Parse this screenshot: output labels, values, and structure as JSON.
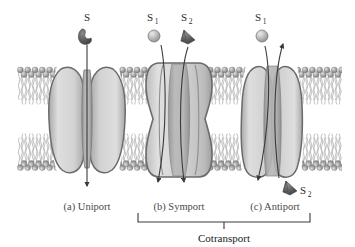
{
  "figure": {
    "background": "#ffffff"
  },
  "colors": {
    "protein_fill_light": "#dcdcdc",
    "protein_fill_mid": "#c2c2c2",
    "protein_outline": "#6e6e6e",
    "protein_channel": "#9a9a9a",
    "lipid_head": "#a3a3a3",
    "lipid_head_dark": "#7d7d7d",
    "lipid_tail": "#b5b5b5",
    "solute_dark": "#5d5d5d",
    "solute_light": "#b9b9b9",
    "arrow": "#3a3a3a",
    "label_gray": "#4a4a4a",
    "label_dark": "#1a1a1a"
  },
  "panels": [
    {
      "id": "uniport",
      "label": "(a) Uniport"
    },
    {
      "id": "symport",
      "label": "(b) Symport"
    },
    {
      "id": "antiport",
      "label": "(c) Antiport"
    }
  ],
  "solutes": {
    "uniport": [
      {
        "name": "S",
        "base": "S",
        "sub": "",
        "shape": "crescent",
        "shade": "dark",
        "direction": "inward"
      }
    ],
    "symport": [
      {
        "name": "S1",
        "base": "S",
        "sub": "1",
        "shape": "sphere",
        "shade": "light",
        "direction": "inward"
      },
      {
        "name": "S2",
        "base": "S",
        "sub": "2",
        "shape": "wedge",
        "shade": "dark",
        "direction": "inward"
      }
    ],
    "antiport": [
      {
        "name": "S1",
        "base": "S",
        "sub": "1",
        "shape": "sphere",
        "shade": "light",
        "direction": "inward"
      },
      {
        "name": "S2",
        "base": "S",
        "sub": "2",
        "shape": "wedge",
        "shade": "dark",
        "direction": "outward"
      }
    ]
  },
  "bracket": {
    "label": "Cotransport",
    "spans": [
      "symport",
      "antiport"
    ]
  },
  "membrane": {
    "left": 17,
    "right": 342,
    "top": 66,
    "bottom": 172,
    "leaflets": 2
  }
}
